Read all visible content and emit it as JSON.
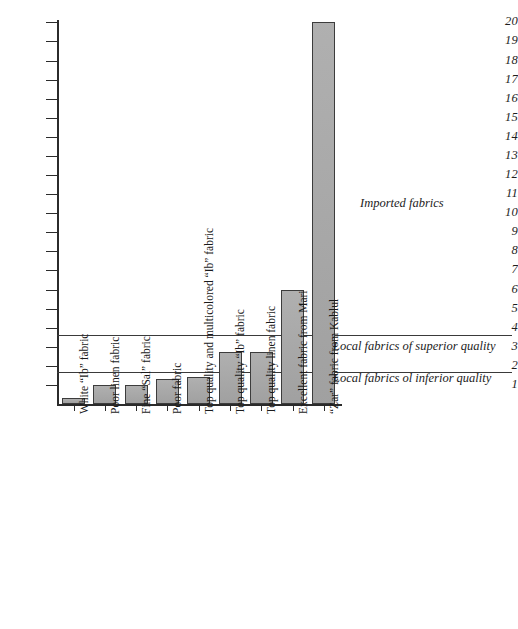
{
  "chart_data": {
    "type": "bar",
    "title": "",
    "subtitle": "",
    "xlabel": "",
    "ylabel": "",
    "ylim": [
      0,
      20
    ],
    "grid": false,
    "legend_position": "none",
    "categories": [
      "White “Ib” fabric",
      "Poor linen fabric",
      "Fine “Sal” fabric",
      "Poor fabric",
      "Top quality and multicolored “Ib” fabric",
      "Top quality “Ib” fabric",
      "Top quality linen fabric",
      "Excellent fabric from Mari",
      "“Zar” fabric from Kablul"
    ],
    "values": [
      0.3,
      1.0,
      1.0,
      1.3,
      1.4,
      2.7,
      2.7,
      6.0,
      20.0
    ],
    "bar_color": "#a9a9a9",
    "bar_edge_color": "#3c3c3c",
    "y_ticks": [
      1,
      2,
      3,
      4,
      5,
      6,
      7,
      8,
      9,
      10,
      11,
      12,
      13,
      14,
      15,
      16,
      17,
      18,
      19,
      20
    ],
    "y_tick_labels": [
      "1",
      "2",
      "3",
      "4",
      "5",
      "6",
      "7",
      "8",
      "9",
      "10",
      "11",
      "12",
      "13",
      "14",
      "15",
      "16",
      "17",
      "18",
      "19",
      "20"
    ],
    "reference_lines": [
      {
        "name": "superior-quality-threshold",
        "value": 3.6
      },
      {
        "name": "inferior-quality-threshold",
        "value": 1.7
      }
    ],
    "annotations": [
      {
        "name": "imported-fabrics",
        "text": "Imported fabrics",
        "value": 10.5
      },
      {
        "name": "local-superior",
        "text": "Local fabrics of superior quality",
        "value": 3.0
      },
      {
        "name": "local-inferior",
        "text": "Local fabrics ol  inferior quality",
        "value": 1.3
      }
    ]
  }
}
